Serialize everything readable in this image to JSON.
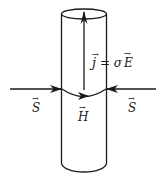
{
  "diagram": {
    "labels": {
      "current": "j = σE",
      "current_j": "j",
      "current_eq": "= σ",
      "current_E": "E",
      "poynting_left": "S",
      "poynting_right": "S",
      "magnetic": "H"
    },
    "colors": {
      "stroke": "#1a1a1a",
      "background": "#ffffff"
    }
  }
}
